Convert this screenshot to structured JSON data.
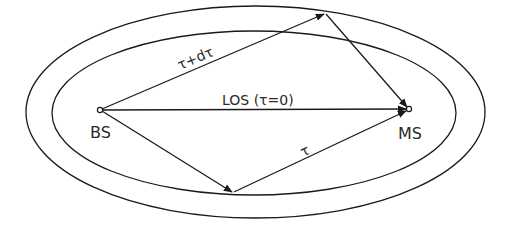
{
  "diagram": {
    "title": "",
    "ellipses": [
      {
        "name": "outer-delay-ellipse",
        "cx": 255.5,
        "cy": 112,
        "rx": 229.5,
        "ry": 106
      },
      {
        "name": "inner-delay-ellipse",
        "cx": 254,
        "cy": 113,
        "rx": 202,
        "ry": 82
      }
    ],
    "nodes": {
      "bs": {
        "label": "BS",
        "x": 100,
        "y": 110
      },
      "ms": {
        "label": "MS",
        "x": 409,
        "y": 109
      }
    },
    "reflection_points": {
      "top": {
        "x": 325,
        "y": 13
      },
      "bottom": {
        "x": 233,
        "y": 193
      }
    },
    "paths": {
      "los": {
        "label": "LOS (τ=0)"
      },
      "outer": {
        "label": "τ+dτ"
      },
      "inner": {
        "label": "τ"
      }
    },
    "colors": {
      "stroke": "#1a1a1a",
      "text": "#2a2a2a",
      "background": "#ffffff"
    }
  }
}
